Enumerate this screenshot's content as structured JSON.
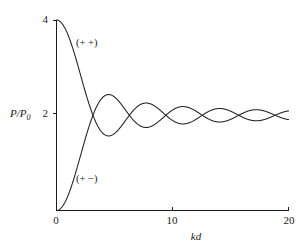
{
  "chart_data": {
    "type": "line",
    "title": "",
    "subtitle": "",
    "xlabel": "kd",
    "ylabel": "P/P0",
    "ylabel_display": "P/P",
    "ylabel_sub": "0",
    "xlim": [
      0,
      20
    ],
    "ylim": [
      0,
      4
    ],
    "xticks": [
      0,
      10,
      20
    ],
    "xtick_labels": [
      "0",
      "10",
      "20"
    ],
    "yticks": [
      0,
      2,
      4
    ],
    "ytick_labels": [
      "0",
      "2",
      "4"
    ],
    "ytick_labels_drawn": [
      "4",
      "2",
      "0"
    ],
    "grid": false,
    "legend_position": "inline-annotation",
    "annotations": [
      {
        "text": "(+ +)",
        "kd": 3.8,
        "value": 3.45,
        "series": "plus-plus"
      },
      {
        "text": "(+ −)",
        "kd": 3.9,
        "value": 0.65,
        "series": "plus-minus"
      }
    ],
    "series": [
      {
        "name": "(+ +)",
        "formula": "2 + 2*sin(kd)/(kd)",
        "start_value": 4,
        "x": [
          0,
          0.5,
          1,
          1.5,
          2,
          2.5,
          3,
          3.5,
          4,
          4.5,
          5,
          5.5,
          6,
          6.5,
          7,
          7.5,
          8,
          8.5,
          9,
          9.5,
          10,
          10.5,
          11,
          11.5,
          12,
          12.5,
          13,
          13.5,
          14,
          14.5,
          15,
          15.5,
          16,
          16.5,
          17,
          17.5,
          18,
          18.5,
          19,
          19.5,
          20
        ],
        "values": [
          4.0,
          3.918,
          3.683,
          3.33,
          2.909,
          2.479,
          2.094,
          1.8,
          1.622,
          1.565,
          1.617,
          1.75,
          1.907,
          2.066,
          2.188,
          2.25,
          2.247,
          2.186,
          2.092,
          1.989,
          1.891,
          1.833,
          1.818,
          1.842,
          1.894,
          1.956,
          2.065,
          2.12,
          2.142,
          2.136,
          2.065,
          1.994,
          1.964,
          1.899,
          1.887,
          1.888,
          1.917,
          1.978,
          2.016,
          2.051,
          2.091
        ]
      },
      {
        "name": "(+ −)",
        "formula": "2 - 2*sin(kd)/(kd)",
        "start_value": 0,
        "x": [
          0,
          0.5,
          1,
          1.5,
          2,
          2.5,
          3,
          3.5,
          4,
          4.5,
          5,
          5.5,
          6,
          6.5,
          7,
          7.5,
          8,
          8.5,
          9,
          9.5,
          10,
          10.5,
          11,
          11.5,
          12,
          12.5,
          13,
          13.5,
          14,
          14.5,
          15,
          15.5,
          16,
          16.5,
          17,
          17.5,
          18,
          18.5,
          19,
          19.5,
          20
        ],
        "values": [
          0.0,
          0.082,
          0.317,
          0.67,
          1.091,
          1.521,
          1.906,
          2.2,
          2.378,
          2.435,
          2.383,
          2.25,
          2.093,
          1.934,
          1.812,
          1.75,
          1.753,
          1.814,
          1.908,
          2.011,
          2.109,
          2.167,
          2.182,
          2.158,
          2.106,
          2.044,
          1.935,
          1.88,
          1.858,
          1.864,
          1.935,
          2.006,
          2.036,
          2.101,
          2.113,
          2.112,
          2.083,
          2.022,
          1.984,
          1.949,
          1.909
        ]
      }
    ]
  },
  "figure": {
    "y_axis_name": "y-axis",
    "x_axis_name": "x-axis"
  }
}
